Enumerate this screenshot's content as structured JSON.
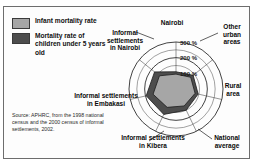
{
  "legend": {
    "items": [
      {
        "label": "Infant mortality rate",
        "color": "#a6a6a6",
        "swatch_name": "legend-swatch-infant"
      },
      {
        "label": "Mortality rate of children under 5 years old",
        "color": "#4d4d4d",
        "swatch_name": "legend-swatch-under5"
      }
    ]
  },
  "source": {
    "text": "Source: APHRC, from the 1998 national census and the 2000 census of informal settlements, 2002."
  },
  "chart_data": {
    "type": "radar",
    "title": "",
    "unit": "%",
    "rings": [
      {
        "label": "100 %",
        "value": 100
      },
      {
        "label": "200 %",
        "value": 200
      },
      {
        "label": "300 %",
        "value": 300
      }
    ],
    "rmax": 300,
    "grid": true,
    "legend_position": "top-left",
    "categories": [
      "Nairobi",
      "Other urban areas",
      "Rural area",
      "National average",
      "Informal settlements in Kibera",
      "Informal settlements in Embakasi",
      "Informal settlements in Nairobi"
    ],
    "series": [
      {
        "name": "Infant mortality rate",
        "color": "#a6a6a6",
        "values": [
          95,
          120,
          125,
          120,
          130,
          150,
          135
        ]
      },
      {
        "name": "Mortality rate of children under 5 years old",
        "color": "#4d4d4d",
        "values": [
          110,
          140,
          145,
          150,
          180,
          195,
          175
        ]
      }
    ],
    "axis_labels": [
      {
        "text": "Nairobi",
        "name": "axis-label-nairobi"
      },
      {
        "text": "Other urban areas",
        "name": "axis-label-other-urban-areas"
      },
      {
        "text": "Rural area",
        "name": "axis-label-rural-area"
      },
      {
        "text": "National average",
        "name": "axis-label-national-average"
      },
      {
        "text": "Informal settlements in Kibera",
        "name": "axis-label-informal-kibera"
      },
      {
        "text": "Informal settlements in Embakasi",
        "name": "axis-label-informal-embakasi"
      },
      {
        "text": "Informal settlements in Nairobi",
        "name": "axis-label-informal-nairobi"
      }
    ],
    "axis_label_lines": {
      "nairobi": [
        "Nairobi"
      ],
      "other_urban": [
        "Other",
        "urban",
        "areas"
      ],
      "rural": [
        "Rural",
        "area"
      ],
      "national": [
        "National",
        "average"
      ],
      "kibera": [
        "Informal settlements",
        "in Kibera"
      ],
      "embakasi": [
        "Informal settlements",
        "in Embakasi"
      ],
      "informal_nairobi": [
        "Informal",
        "settlements",
        "in Nairobi"
      ]
    }
  }
}
